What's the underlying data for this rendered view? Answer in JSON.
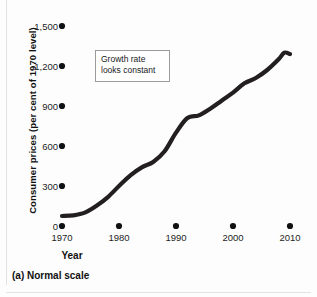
{
  "figure": {
    "caption": "(a) Normal scale",
    "annotation": {
      "line1": "Growth rate",
      "line2": "looks constant"
    }
  },
  "chart_data": {
    "type": "line",
    "title": "",
    "xlabel": "Year",
    "ylabel": "Consumer prices (per cent of 1970 level)",
    "xlim": [
      1970,
      2010
    ],
    "ylim": [
      0,
      1500
    ],
    "xticks": [
      "1970",
      "1980",
      "1990",
      "2000",
      "2010"
    ],
    "yticks": [
      "0",
      "300",
      "600",
      "900",
      "1,200",
      "1,500"
    ],
    "ytick_values": [
      0,
      300,
      600,
      900,
      1200,
      1500
    ],
    "xtick_values": [
      1970,
      1980,
      1990,
      2000,
      2010
    ],
    "grid": false,
    "legend": "none",
    "tick_marker": "filled-dot",
    "series": [
      {
        "name": "Consumer prices",
        "color": "#231f20",
        "x": [
          1970,
          1972,
          1974,
          1976,
          1978,
          1980,
          1982,
          1984,
          1986,
          1988,
          1990,
          1992,
          1994,
          1996,
          1998,
          2000,
          2002,
          2004,
          2006,
          2008,
          2009,
          2010
        ],
        "values": [
          75,
          80,
          100,
          150,
          215,
          300,
          380,
          440,
          480,
          560,
          700,
          810,
          830,
          880,
          940,
          1000,
          1070,
          1110,
          1170,
          1250,
          1300,
          1290
        ]
      }
    ]
  }
}
